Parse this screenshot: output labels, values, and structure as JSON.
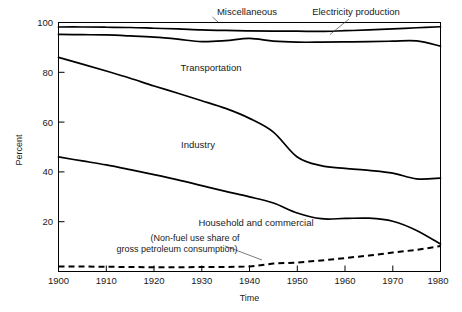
{
  "figure": {
    "background": "#ffffff",
    "line_color": "#000000"
  },
  "chart_data": {
    "type": "line",
    "title": "",
    "subtitle": "",
    "xlabel": "Time",
    "ylabel": "Percent",
    "xlim": [
      1900,
      1980
    ],
    "ylim": [
      0,
      100
    ],
    "xticks": [
      1900,
      1910,
      1920,
      1930,
      1940,
      1950,
      1960,
      1970,
      1980
    ],
    "yticks": [
      20,
      40,
      60,
      80,
      100
    ],
    "grid": false,
    "legend": "inline annotations",
    "note": "Cumulative share boundaries of U.S. energy end-use by sector; curves are stacked cumulative percentages.",
    "x": [
      1900,
      1905,
      1910,
      1915,
      1920,
      1925,
      1930,
      1935,
      1940,
      1945,
      1950,
      1955,
      1960,
      1965,
      1970,
      1975,
      1980
    ],
    "series": [
      {
        "name": "Miscellaneous",
        "style": "solid",
        "label": "Miscellaneous",
        "values": [
          98.2,
          98.2,
          98.1,
          98.0,
          97.7,
          97.4,
          97.0,
          96.8,
          96.6,
          96.5,
          96.5,
          96.4,
          96.7,
          97.0,
          97.4,
          97.9,
          98.3
        ]
      },
      {
        "name": "Electricity production",
        "style": "solid",
        "label": "Electricity production",
        "values": [
          95.2,
          95.1,
          95.0,
          94.6,
          94.1,
          93.3,
          92.3,
          92.7,
          93.6,
          92.5,
          92.1,
          92.1,
          92.2,
          92.3,
          92.5,
          92.6,
          90.5
        ]
      },
      {
        "name": "Transportation",
        "style": "solid",
        "label": "Transportation",
        "values": [
          86.0,
          83.3,
          80.5,
          77.6,
          74.5,
          71.6,
          68.6,
          65.5,
          61.5,
          56.0,
          46.0,
          42.5,
          41.4,
          40.6,
          39.5,
          37.2,
          37.5
        ]
      },
      {
        "name": "Industry",
        "style": "solid",
        "label": "Industry",
        "values": [
          46.0,
          44.4,
          42.8,
          40.9,
          38.9,
          36.8,
          34.5,
          32.2,
          30.0,
          27.5,
          23.5,
          21.2,
          21.3,
          21.4,
          20.2,
          16.5,
          11.0
        ]
      },
      {
        "name": "Household and commercial",
        "style": "solid",
        "label": "Household and commercial"
      },
      {
        "name": "Non-fuel use share of gross petroleum consumption",
        "style": "dashed",
        "label": "(Non-fuel use share of gross petroleum consumption)",
        "values": [
          2.0,
          2.0,
          1.9,
          1.8,
          1.7,
          1.7,
          1.8,
          1.8,
          2.0,
          3.2,
          3.6,
          4.4,
          5.4,
          6.4,
          7.6,
          8.7,
          10.2
        ]
      }
    ],
    "annotations": [
      {
        "text": "Miscellaneous",
        "x": 1932,
        "y": 103,
        "leader": true
      },
      {
        "text": "Electricity production",
        "x": 1958,
        "y": 103,
        "leader": true
      },
      {
        "text": "Transportation",
        "x": 1933,
        "y": 79,
        "leader": false
      },
      {
        "text": "Industry",
        "x": 1930,
        "y": 50,
        "leader": false
      },
      {
        "text": "Household and commercial",
        "x": 1943,
        "y": 17,
        "leader": false
      },
      {
        "text": "(Non-fuel use share of",
        "x": 1925,
        "y": 10,
        "leader": false
      },
      {
        "text": "gross petroleum consumption)",
        "x": 1925,
        "y": 6,
        "leader": true
      }
    ]
  },
  "axes": {
    "y_tick_labels": [
      "100",
      "80",
      "60",
      "40",
      "20"
    ],
    "x_tick_labels": [
      "1900",
      "1910",
      "1920",
      "1930",
      "1940",
      "1950",
      "1960",
      "1970",
      "1980"
    ],
    "y_axis_title": "Percent",
    "x_axis_title": "Time"
  },
  "labels": {
    "miscellaneous": "Miscellaneous",
    "electricity": "Electricity production",
    "transportation": "Transportation",
    "industry": "Industry",
    "household": "Household and commercial",
    "nonfuel_line1": "(Non-fuel use share of",
    "nonfuel_line2": "gross petroleum consumption)"
  }
}
